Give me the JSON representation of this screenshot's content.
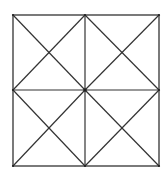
{
  "figure": {
    "outer_square": {
      "x1": 13,
      "y1": 15,
      "x2": 159,
      "y2": 166
    },
    "center": {
      "x": 85,
      "y": 90
    },
    "stroke_color": "#333333",
    "background": "#ffffff"
  }
}
